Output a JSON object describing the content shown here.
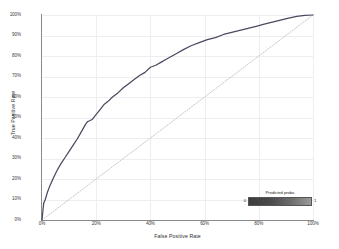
{
  "chart_data": {
    "type": "line",
    "title": "",
    "xlabel": "False Positive Rate",
    "ylabel": "True Positive Rate",
    "xlim": [
      0,
      100
    ],
    "ylim": [
      0,
      100
    ],
    "grid": true,
    "xticklabels": [
      "0%",
      "20%",
      "40%",
      "60%",
      "80%",
      "100%"
    ],
    "xtickvalues": [
      0,
      20,
      40,
      60,
      80,
      100
    ],
    "yticklabels": [
      "0%",
      "10%",
      "20%",
      "30%",
      "40%",
      "50%",
      "60%",
      "70%",
      "80%",
      "90%",
      "100%"
    ],
    "ytickvalues": [
      0,
      10,
      20,
      30,
      40,
      50,
      60,
      70,
      80,
      90,
      100
    ],
    "series": [
      {
        "name": "ROC curve",
        "style": "solid",
        "color": "#4a4a5e",
        "x": [
          0,
          0.3,
          0.6,
          1.2,
          2.0,
          3.0,
          4.2,
          5.5,
          7.0,
          8.5,
          10.0,
          11.5,
          13.0,
          14.5,
          16.0,
          16.8,
          17.6,
          18.5,
          20.0,
          21.5,
          23.0,
          24.5,
          26.0,
          28.0,
          30.0,
          32.0,
          34.0,
          36.0,
          38.0,
          40.0,
          42.0,
          44.0,
          46.0,
          48.0,
          50.0,
          52.0,
          55.0,
          58.0,
          61.0,
          64.0,
          67.0,
          70.0,
          73.0,
          76.0,
          79.0,
          82.0,
          85.0,
          88.0,
          91.0,
          94.0,
          97.0,
          100.0
        ],
        "y": [
          0,
          4.0,
          8.0,
          10.0,
          13.5,
          17.0,
          20.5,
          24.0,
          27.5,
          30.5,
          33.5,
          36.5,
          39.5,
          43.0,
          46.5,
          48.0,
          48.4,
          49.0,
          51.5,
          54.0,
          56.5,
          58.0,
          60.0,
          62.0,
          64.5,
          66.5,
          68.5,
          70.5,
          72.0,
          74.5,
          75.5,
          77.0,
          78.5,
          80.0,
          81.5,
          83.0,
          85.0,
          86.5,
          88.0,
          89.0,
          90.5,
          91.5,
          92.5,
          93.5,
          94.5,
          95.5,
          96.5,
          97.5,
          98.5,
          99.3,
          99.8,
          100.0
        ]
      },
      {
        "name": "Chance line",
        "style": "dotted",
        "color": "#b5b5bd",
        "x": [
          0,
          100
        ],
        "y": [
          0,
          100
        ]
      }
    ],
    "legend": {
      "position": "bottom-right",
      "title": "Predicted proba",
      "min_label": "0",
      "max_label": "1",
      "type": "colorbar",
      "colorbar_from": "#3d3d3d",
      "colorbar_to": "#9a9a9a"
    }
  }
}
